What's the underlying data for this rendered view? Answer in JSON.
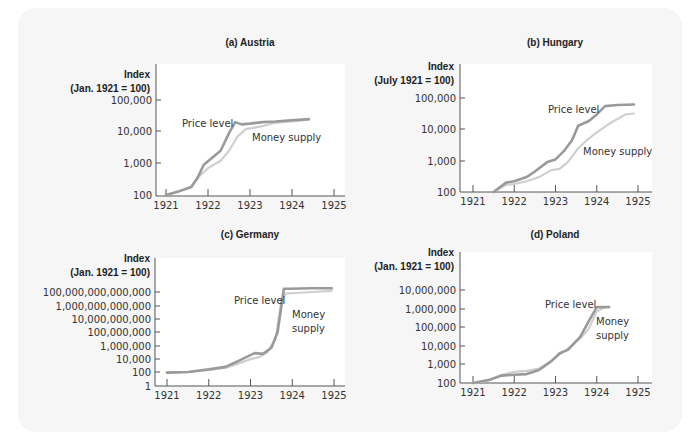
{
  "chart_data": [
    {
      "id": "austria",
      "type": "line",
      "title": "(a) Austria",
      "ylabel_line1": "Index",
      "ylabel_line2": "(Jan. 1921 = 100)",
      "yscale": "log",
      "y_ticks": [
        "100,000",
        "10,000",
        "1,000",
        "100"
      ],
      "x_ticks": [
        "1921",
        "1922",
        "1923",
        "1924",
        "1925"
      ],
      "xlim": [
        1921,
        1925
      ],
      "ylim": [
        100,
        100000
      ],
      "annotations": [
        "Price level",
        "Money supply"
      ],
      "series": [
        {
          "name": "Price level",
          "x": [
            1921.0,
            1921.3,
            1921.6,
            1921.75,
            1921.9,
            1922.1,
            1922.3,
            1922.5,
            1922.65,
            1922.8,
            1923.0,
            1923.3,
            1923.6,
            1924.0,
            1924.4
          ],
          "values": [
            100,
            130,
            180,
            350,
            900,
            1500,
            2500,
            9000,
            20000,
            17000,
            18000,
            20000,
            21000,
            23000,
            25000
          ]
        },
        {
          "name": "Money supply",
          "x": [
            1921.0,
            1921.3,
            1921.6,
            1921.8,
            1922.0,
            1922.3,
            1922.5,
            1922.7,
            1922.9,
            1923.3,
            1923.6,
            1924.0,
            1924.4
          ],
          "values": [
            100,
            130,
            170,
            400,
            700,
            1200,
            2500,
            7000,
            12000,
            15000,
            19000,
            21000,
            24000
          ]
        }
      ]
    },
    {
      "id": "hungary",
      "type": "line",
      "title": "(b) Hungary",
      "ylabel_line1": "Index",
      "ylabel_line2": "(July 1921 = 100)",
      "yscale": "log",
      "y_ticks": [
        "100,000",
        "10,000",
        "1,000",
        "100"
      ],
      "x_ticks": [
        "1921",
        "1922",
        "1923",
        "1924",
        "1925"
      ],
      "xlim": [
        1921,
        1925
      ],
      "ylim": [
        100,
        100000
      ],
      "annotations": [
        "Price level",
        "Money supply"
      ],
      "series": [
        {
          "name": "Price level",
          "x": [
            1921.5,
            1921.8,
            1922.0,
            1922.3,
            1922.5,
            1922.8,
            1923.0,
            1923.2,
            1923.4,
            1923.55,
            1923.8,
            1924.0,
            1924.2,
            1924.5,
            1924.9
          ],
          "values": [
            100,
            200,
            220,
            300,
            450,
            900,
            1100,
            2000,
            4500,
            13000,
            18000,
            30000,
            55000,
            60000,
            62000
          ]
        },
        {
          "name": "Money supply",
          "x": [
            1921.5,
            1921.8,
            1922.0,
            1922.3,
            1922.6,
            1922.9,
            1923.1,
            1923.3,
            1923.55,
            1923.8,
            1924.0,
            1924.3,
            1924.7,
            1924.9
          ],
          "values": [
            100,
            170,
            180,
            220,
            300,
            500,
            550,
            900,
            2500,
            5000,
            8000,
            15000,
            30000,
            32000
          ]
        }
      ]
    },
    {
      "id": "germany",
      "type": "line",
      "title": "(c) Germany",
      "ylabel_line1": "Index",
      "ylabel_line2": "(Jan. 1921 = 100)",
      "yscale": "log",
      "y_ticks": [
        "100,000,000,000,000",
        "1,000,000,000,000",
        "10,000,000,000",
        "100,000,000",
        "1,000,000",
        "10,000",
        "100",
        "1"
      ],
      "x_ticks": [
        "1921",
        "1922",
        "1923",
        "1924",
        "1925"
      ],
      "xlim": [
        1921,
        1925
      ],
      "ylim": [
        1,
        100000000000000
      ],
      "annotations": [
        "Price level",
        "Money supply"
      ],
      "series": [
        {
          "name": "Price level",
          "x": [
            1921.0,
            1921.5,
            1922.0,
            1922.4,
            1922.7,
            1923.0,
            1923.1,
            1923.3,
            1923.5,
            1923.65,
            1923.8,
            1923.9,
            1924.5,
            1924.95
          ],
          "values": [
            100,
            120,
            300,
            700,
            5000,
            40000,
            80000,
            60000,
            500000,
            100000000,
            300000000000000,
            300000000000000,
            350000000000000,
            350000000000000
          ]
        },
        {
          "name": "Money supply",
          "x": [
            1921.0,
            1921.5,
            1922.0,
            1922.4,
            1922.7,
            1923.0,
            1923.2,
            1923.4,
            1923.6,
            1923.75,
            1923.85,
            1924.5,
            1924.95
          ],
          "values": [
            100,
            120,
            250,
            500,
            2000,
            10000,
            20000,
            100000,
            10000000,
            10000000000000,
            60000000000000,
            100000000000000,
            150000000000000
          ]
        }
      ]
    },
    {
      "id": "poland",
      "type": "line",
      "title": "(d) Poland",
      "ylabel_line1": "Index",
      "ylabel_line2": "(Jan. 1921 = 100)",
      "yscale": "log",
      "y_ticks": [
        "10,000,000",
        "1,000,000",
        "100,000",
        "10,000",
        "1,000",
        "100"
      ],
      "x_ticks": [
        "1921",
        "1922",
        "1923",
        "1924",
        "1925"
      ],
      "xlim": [
        1921,
        1925
      ],
      "ylim": [
        100,
        10000000
      ],
      "annotations": [
        "Price level",
        "Money supply"
      ],
      "series": [
        {
          "name": "Price level",
          "x": [
            1921.0,
            1921.4,
            1921.7,
            1922.0,
            1922.3,
            1922.6,
            1922.9,
            1923.1,
            1923.3,
            1923.6,
            1923.8,
            1924.0,
            1924.3
          ],
          "values": [
            100,
            150,
            250,
            280,
            300,
            500,
            1500,
            4000,
            6000,
            30000,
            200000,
            1200000,
            1200000
          ]
        },
        {
          "name": "Money supply",
          "x": [
            1921.0,
            1921.4,
            1921.7,
            1922.0,
            1922.3,
            1922.6,
            1922.9,
            1923.1,
            1923.3,
            1923.6,
            1923.8,
            1924.0,
            1924.2
          ],
          "values": [
            100,
            140,
            280,
            400,
            450,
            600,
            1500,
            3500,
            7000,
            25000,
            80000,
            700000,
            1200000
          ]
        }
      ]
    }
  ]
}
